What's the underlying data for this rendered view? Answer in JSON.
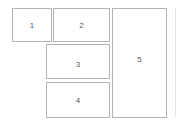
{
  "diagram": {
    "boxes": [
      {
        "label": "1"
      },
      {
        "label": "2"
      },
      {
        "label": "3"
      },
      {
        "label": "4"
      },
      {
        "label": "5"
      }
    ]
  }
}
